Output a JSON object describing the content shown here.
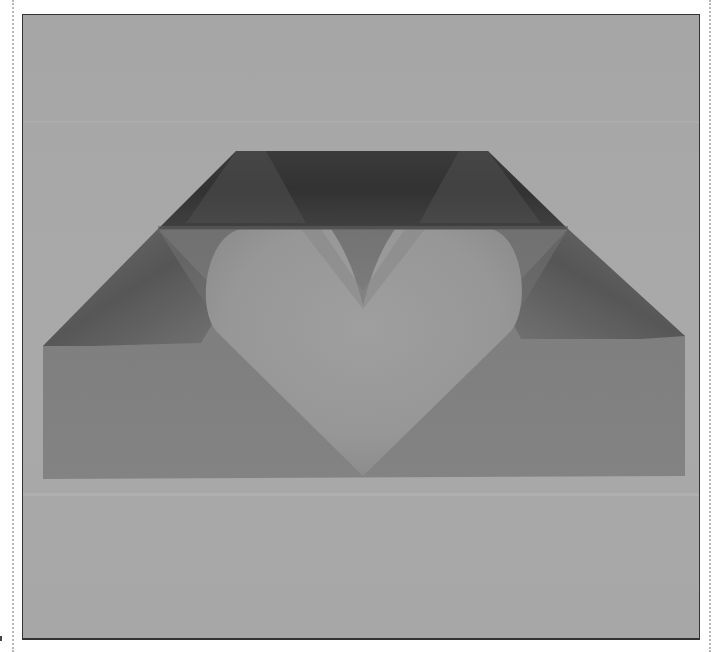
{
  "image": {
    "description": "Grayscale photograph of a folded origami heart envelope on a gray background",
    "subject": "origami heart envelope",
    "colors": {
      "background": "#a9a9a9",
      "background_light_band": "#b0b0b0",
      "top_flap_dark": "#2e2e2e",
      "top_flap_mid": "#3c3c3c",
      "side_flap_dark": "#555555",
      "side_panel": "#7d7d7d",
      "heart": "#989898",
      "heart_notch": "#8a8a8a",
      "frame_border": "#333333",
      "dotted_guides": "#b8b8b8"
    }
  }
}
